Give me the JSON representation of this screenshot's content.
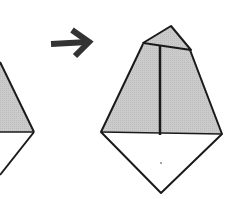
{
  "diagram": {
    "type": "origami-step",
    "description": "Origami folding step: previous shape on left, arrow, resulting shape on right",
    "colors": {
      "fill_shaded": "#c8c8c8",
      "fill_paper": "#ffffff",
      "stroke": "#1a1a1a",
      "arrow": "#333333"
    },
    "elements": [
      {
        "id": "previous-shape",
        "label": "previous fold (partially visible)"
      },
      {
        "id": "step-arrow",
        "label": "next step arrow"
      },
      {
        "id": "result-shape",
        "label": "folded kite with top flap"
      }
    ]
  }
}
